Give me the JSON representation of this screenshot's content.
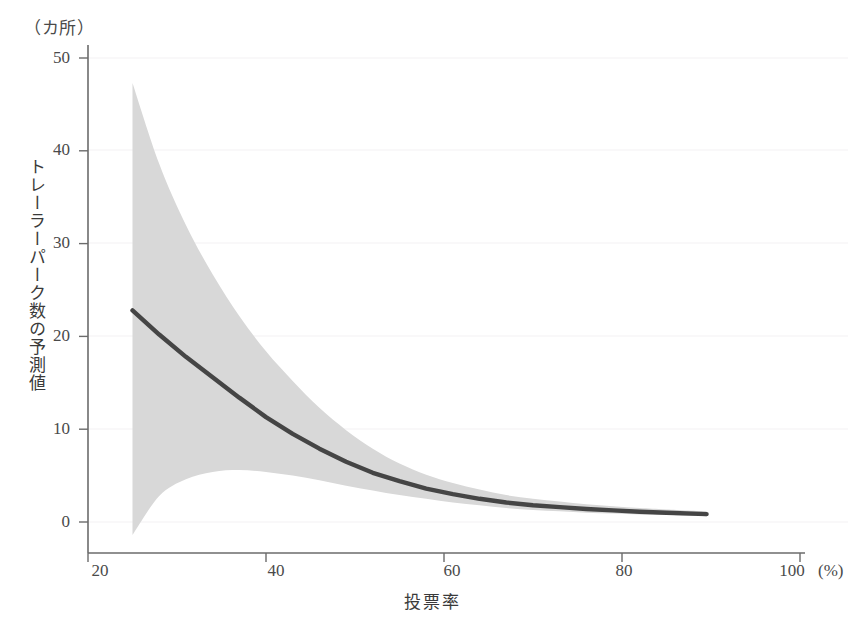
{
  "chart_data": {
    "type": "line",
    "title": "",
    "xlabel": "投票率",
    "ylabel": "トレーラーパーク数の予測値",
    "x_unit": "(%)",
    "y_unit": "（カ所）",
    "xlim": [
      20,
      100
    ],
    "ylim": [
      0,
      50
    ],
    "xticks": [
      20,
      40,
      60,
      80,
      100
    ],
    "yticks": [
      0,
      10,
      20,
      30,
      40,
      50
    ],
    "xtick_labels": [
      "20",
      "40",
      "60",
      "80",
      "100"
    ],
    "ytick_labels": [
      "0",
      "10",
      "20",
      "30",
      "40",
      "50"
    ],
    "grid": "horizontal-faint",
    "legend": "none",
    "colors": {
      "line": "#454545",
      "band": "#d8d8d8",
      "axis": "#6b6b6b",
      "gridline": "#f2f0f2",
      "text": "#3a3a3a",
      "background": "#ffffff"
    },
    "series": [
      {
        "name": "予測値",
        "kind": "fit-line",
        "x": [
          25,
          28,
          31,
          34,
          37,
          40,
          43,
          46,
          49,
          52,
          55,
          58,
          61,
          64,
          67,
          70,
          73,
          76,
          79,
          82,
          85,
          89.5
        ],
        "values": [
          22.8,
          20.2,
          17.8,
          15.6,
          13.4,
          11.3,
          9.5,
          7.9,
          6.5,
          5.3,
          4.4,
          3.6,
          3.0,
          2.5,
          2.1,
          1.8,
          1.6,
          1.4,
          1.25,
          1.1,
          1.0,
          0.85
        ]
      },
      {
        "name": "信頼区間（上限）",
        "kind": "confidence-upper",
        "x": [
          25,
          28,
          31,
          34,
          37,
          40,
          43,
          46,
          49,
          52,
          55,
          58,
          61,
          64,
          67,
          70,
          73,
          76,
          79,
          82,
          85,
          89.5
        ],
        "values": [
          47.3,
          38.6,
          32.0,
          26.7,
          22.2,
          18.4,
          15.2,
          12.3,
          9.9,
          7.9,
          6.3,
          5.1,
          4.2,
          3.5,
          2.9,
          2.5,
          2.2,
          1.9,
          1.7,
          1.5,
          1.35,
          1.15
        ]
      },
      {
        "name": "信頼区間（下限）",
        "kind": "confidence-lower",
        "x": [
          25,
          28,
          31,
          34,
          37,
          40,
          43,
          46,
          49,
          52,
          55,
          58,
          61,
          64,
          67,
          70,
          73,
          76,
          79,
          82,
          85,
          89.5
        ],
        "values": [
          -1.4,
          2.8,
          4.6,
          5.4,
          5.6,
          5.4,
          5.0,
          4.5,
          3.9,
          3.4,
          2.9,
          2.5,
          2.1,
          1.8,
          1.5,
          1.3,
          1.15,
          1.0,
          0.92,
          0.82,
          0.75,
          0.6
        ]
      }
    ]
  }
}
